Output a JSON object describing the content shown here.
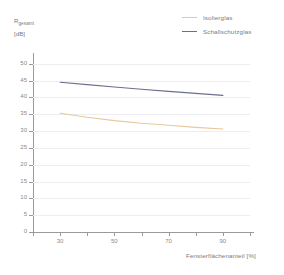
{
  "chart_data": {
    "type": "line",
    "title": "",
    "xlabel": "Fensterflächenanteil [%]",
    "ylabel": "R",
    "ylabel_sub": "gesamt",
    "ylabel_unit": "[dB]",
    "xlim": [
      20,
      100
    ],
    "ylim": [
      0,
      52
    ],
    "grid": true,
    "legend_position": "top-right",
    "xticks": [
      30,
      50,
      70,
      90
    ],
    "xtick_labels": [
      "30",
      "50",
      "70",
      "90"
    ],
    "xminor_ticks": [
      20,
      40,
      60,
      80,
      100
    ],
    "yticks": [
      0,
      5,
      10,
      15,
      20,
      25,
      30,
      35,
      40,
      45,
      50
    ],
    "ytick_labels": [
      "0",
      "5",
      "10",
      "15",
      "20",
      "25",
      "30",
      "35",
      "40",
      "45",
      "50"
    ],
    "x": [
      30,
      40,
      50,
      60,
      70,
      80,
      90
    ],
    "series": [
      {
        "name": "Isolierglas",
        "color": "#e8c89a",
        "values": [
          35.3,
          34.1,
          33.1,
          32.3,
          31.7,
          31.1,
          30.6
        ]
      },
      {
        "name": "Schallschutzglas",
        "color": "#6b6f8e",
        "values": [
          44.5,
          43.8,
          43.1,
          42.4,
          41.8,
          41.2,
          40.6
        ]
      }
    ]
  },
  "legend": {
    "items": [
      {
        "label": "Isolierglas",
        "color": "#e8c89a"
      },
      {
        "label": "Schallschutzglas",
        "color": "#6b6f8e"
      }
    ]
  }
}
